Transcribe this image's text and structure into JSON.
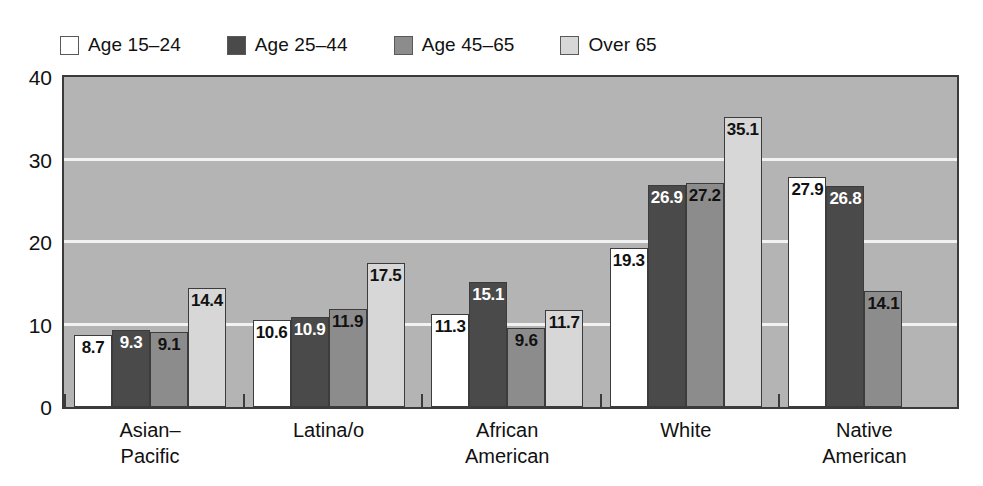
{
  "legend": {
    "items": [
      {
        "label": "Age 15–24",
        "color": "#ffffff"
      },
      {
        "label": "Age 25–44",
        "color": "#4a4a4a"
      },
      {
        "label": "Age 45–65",
        "color": "#8c8c8c"
      },
      {
        "label": "Over 65",
        "color": "#d7d7d7"
      }
    ]
  },
  "axis": {
    "y_ticks": [
      "0",
      "10",
      "20",
      "30",
      "40"
    ]
  },
  "chart_data": {
    "type": "bar",
    "title": "",
    "xlabel": "",
    "ylabel": "",
    "ylim": [
      0,
      40
    ],
    "yticks": [
      0,
      10,
      20,
      30,
      40
    ],
    "grid": true,
    "legend_position": "top-left",
    "categories": [
      "Asian–\nPacific",
      "Latina/o",
      "African\nAmerican",
      "White",
      "Native\nAmerican"
    ],
    "series": [
      {
        "name": "Age 15–24",
        "color": "#ffffff",
        "label_color": "#111111",
        "values": [
          8.7,
          10.6,
          11.3,
          19.3,
          27.9
        ]
      },
      {
        "name": "Age 25–44",
        "color": "#4a4a4a",
        "label_color": "#ffffff",
        "values": [
          9.3,
          10.9,
          15.1,
          26.9,
          26.8
        ]
      },
      {
        "name": "Age 45–65",
        "color": "#8c8c8c",
        "label_color": "#111111",
        "values": [
          9.1,
          11.9,
          9.6,
          27.2,
          14.1
        ]
      },
      {
        "name": "Over 65",
        "color": "#d7d7d7",
        "label_color": "#111111",
        "values": [
          14.4,
          17.5,
          11.7,
          35.1,
          null
        ]
      }
    ],
    "value_labels": [
      [
        "8.7",
        "9.3",
        "9.1",
        "14.4"
      ],
      [
        "10.6",
        "10.9",
        "11.9",
        "17.5"
      ],
      [
        "11.3",
        "15.1",
        "9.6",
        "11.7"
      ],
      [
        "19.3",
        "26.9",
        "27.2",
        "35.1"
      ],
      [
        "27.9",
        "26.8",
        "14.1",
        ""
      ]
    ]
  },
  "style": {
    "plot_background": "#b4b4b4",
    "gridline_color": "#f2f2f2",
    "axis_color": "#3a3a3a",
    "page_background": "#ffffff"
  }
}
